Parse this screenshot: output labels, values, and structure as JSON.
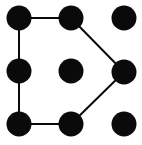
{
  "figure": {
    "title": "Dot grid with closed polygon",
    "width": 142,
    "height": 145,
    "background_color": "#ffffff",
    "dot_color": "#0a0a0a",
    "line_color": "#0a0a0a",
    "dot_radius": 12.5,
    "line_width": 2
  },
  "chart_data": {
    "type": "scatter",
    "title": "Dot grid with closed polygon",
    "xlabel": "",
    "ylabel": "",
    "grid": false,
    "legend": false,
    "xlim": [
      0,
      142
    ],
    "ylim": [
      0,
      145
    ],
    "rows": 3,
    "cols": 3,
    "points": [
      {
        "id": "top-left",
        "row": 0,
        "col": 0,
        "x": 19,
        "y": 18,
        "on_polygon": true
      },
      {
        "id": "top-middle",
        "row": 0,
        "col": 1,
        "x": 71,
        "y": 18,
        "on_polygon": true
      },
      {
        "id": "top-right",
        "row": 0,
        "col": 2,
        "x": 124,
        "y": 18,
        "on_polygon": false
      },
      {
        "id": "middle-left",
        "row": 1,
        "col": 0,
        "x": 19,
        "y": 71,
        "on_polygon": true
      },
      {
        "id": "center",
        "row": 1,
        "col": 1,
        "x": 71,
        "y": 71,
        "on_polygon": false
      },
      {
        "id": "middle-right",
        "row": 1,
        "col": 2,
        "x": 124,
        "y": 72,
        "on_polygon": true
      },
      {
        "id": "bottom-left",
        "row": 2,
        "col": 0,
        "x": 19,
        "y": 124,
        "on_polygon": true
      },
      {
        "id": "bottom-middle",
        "row": 2,
        "col": 1,
        "x": 71,
        "y": 124,
        "on_polygon": true
      },
      {
        "id": "bottom-right",
        "row": 2,
        "col": 2,
        "x": 124,
        "y": 124,
        "on_polygon": false
      }
    ],
    "edges": [
      {
        "id": "edge-top",
        "from": "top-left",
        "to": "top-middle",
        "x1": 19,
        "y1": 18,
        "x2": 71,
        "y2": 18
      },
      {
        "id": "edge-upper-right-diagonal",
        "from": "top-middle",
        "to": "middle-right",
        "x1": 71,
        "y1": 18,
        "x2": 124,
        "y2": 72
      },
      {
        "id": "edge-lower-right-diagonal",
        "from": "middle-right",
        "to": "bottom-middle",
        "x1": 124,
        "y1": 72,
        "x2": 71,
        "y2": 124
      },
      {
        "id": "edge-bottom",
        "from": "bottom-middle",
        "to": "bottom-left",
        "x1": 71,
        "y1": 124,
        "x2": 19,
        "y2": 124
      },
      {
        "id": "edge-left",
        "from": "bottom-left",
        "to": "top-left",
        "x1": 19,
        "y1": 124,
        "x2": 19,
        "y2": 18
      }
    ],
    "polygon_vertex_order": [
      "top-left",
      "top-middle",
      "middle-right",
      "bottom-middle",
      "bottom-left"
    ],
    "polygon_vertex_count": 5,
    "unconnected_points": [
      "top-right",
      "center",
      "bottom-right"
    ]
  }
}
